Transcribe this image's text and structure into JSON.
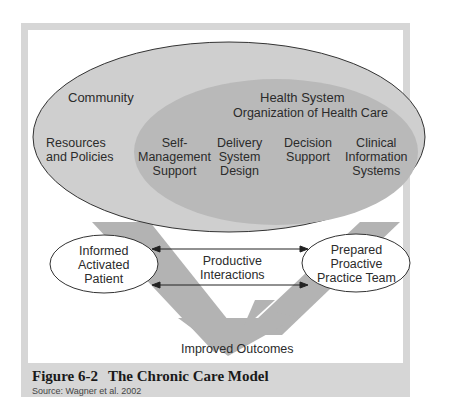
{
  "figure": {
    "number": "Figure 6-2",
    "title": "The Chronic Care Model",
    "source": "Source: Wagner et al. 2002"
  },
  "community": {
    "label": "Community",
    "resources": "Resources\nand Policies"
  },
  "health_system": {
    "title": "Health System",
    "subtitle": "Organization of Health Care",
    "components": [
      {
        "label": "Self-\nManagement\nSupport"
      },
      {
        "label": "Delivery\nSystem\nDesign"
      },
      {
        "label": "Decision\nSupport"
      },
      {
        "label": "Clinical\nInformation\nSystems"
      }
    ]
  },
  "patient": {
    "label": "Informed\nActivated\nPatient"
  },
  "team": {
    "label": "Prepared\nProactive\nPractice Team"
  },
  "interactions": {
    "label": "Productive\nInteractions"
  },
  "outcome": {
    "label": "Improved Outcomes"
  },
  "colors": {
    "frame": "#d6d6d6",
    "outer_ellipse": "#cfcfcf",
    "inner_ellipse": "#b9b9b9",
    "chevron": "#b3b3b3",
    "text": "#2b2b2b"
  }
}
